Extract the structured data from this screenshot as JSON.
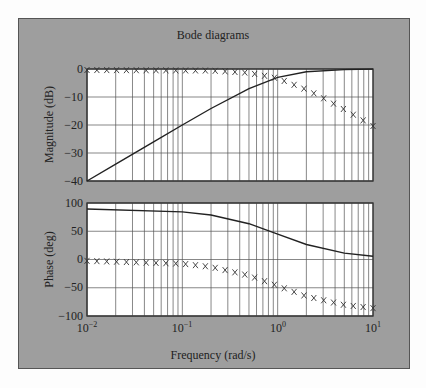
{
  "chart_data": {
    "type": "line",
    "title": "Bode diagrams",
    "xlabel": "Frequency (rad/s)",
    "xscale": "log",
    "xlim": [
      0.01,
      10
    ],
    "x_tick_labels": [
      "10^-2",
      "10^-1",
      "10^0",
      "10^1"
    ],
    "grid": true,
    "subplots": [
      {
        "name": "magnitude",
        "ylabel": "Magnitude (dB)",
        "ylim": [
          -40,
          0
        ],
        "y_ticks": [
          0,
          -10,
          -20,
          -30,
          -40
        ],
        "series": [
          {
            "name": "solid line",
            "style": "line",
            "x": [
              0.01,
              0.02,
              0.05,
              0.1,
              0.2,
              0.5,
              1,
              2,
              5,
              10
            ],
            "values": [
              -40,
              -34,
              -26,
              -20,
              -14.1,
              -7,
              -3,
              -1,
              -0.2,
              -0.04
            ]
          },
          {
            "name": "x markers",
            "style": "marker-x",
            "x": [
              0.01,
              0.2,
              0.5,
              1,
              2,
              3,
              5,
              7,
              10
            ],
            "values": [
              0,
              -0.2,
              -1,
              -3,
              -7,
              -10,
              -14.1,
              -17,
              -20
            ]
          }
        ]
      },
      {
        "name": "phase",
        "ylabel": "Phase (deg)",
        "ylim": [
          -100,
          100
        ],
        "y_ticks": [
          100,
          50,
          0,
          -50,
          -100
        ],
        "series": [
          {
            "name": "solid line",
            "style": "line",
            "x": [
              0.01,
              0.1,
              0.2,
              0.5,
              1,
              2,
              5,
              10
            ],
            "values": [
              89.4,
              84.3,
              78.7,
              63.4,
              45,
              26.6,
              11.3,
              5.7
            ]
          },
          {
            "name": "x markers",
            "style": "marker-x",
            "x": [
              0.01,
              0.1,
              0.2,
              0.5,
              1,
              2,
              5,
              10
            ],
            "values": [
              -0.6,
              -5.7,
              -11.3,
              -26.6,
              -45,
              -63.4,
              -78.7,
              -84.3
            ]
          }
        ]
      }
    ]
  },
  "labels": {
    "title": "Bode diagrams",
    "xlabel": "Frequency (rad/s)",
    "mag_ylabel": "Magnitude (dB)",
    "phase_ylabel": "Phase (deg)",
    "mag_ticks": [
      "0",
      "−10",
      "−20",
      "−30",
      "−40"
    ],
    "phase_ticks": [
      "100",
      "50",
      "0",
      "−50",
      "−100"
    ],
    "x_base": "10",
    "x_exps": [
      "−2",
      "−1",
      "0",
      "1"
    ]
  }
}
